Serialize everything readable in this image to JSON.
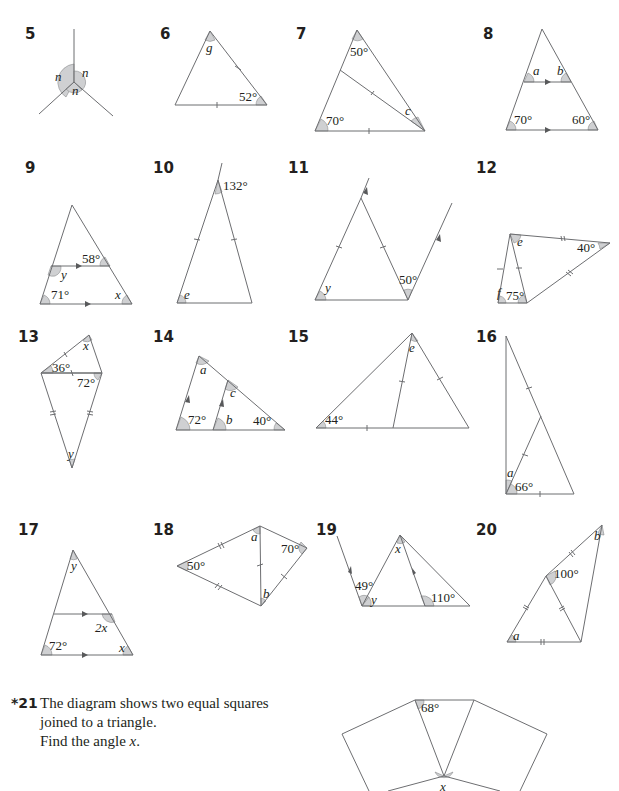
{
  "questions": [
    {
      "number": "5",
      "labels": [
        "n",
        "n",
        "n"
      ]
    },
    {
      "number": "6",
      "labels": [
        "g",
        "52°"
      ]
    },
    {
      "number": "7",
      "labels": [
        "50°",
        "70°",
        "c"
      ]
    },
    {
      "number": "8",
      "labels": [
        "a",
        "b",
        "70°",
        "60°"
      ]
    },
    {
      "number": "9",
      "labels": [
        "58°",
        "y",
        "71°",
        "x"
      ]
    },
    {
      "number": "10",
      "labels": [
        "132°",
        "e"
      ]
    },
    {
      "number": "11",
      "labels": [
        "y",
        "50°"
      ]
    },
    {
      "number": "12",
      "labels": [
        "e",
        "40°",
        "f",
        "75°"
      ]
    },
    {
      "number": "13",
      "labels": [
        "x",
        "36°",
        "72°",
        "y"
      ]
    },
    {
      "number": "14",
      "labels": [
        "a",
        "c",
        "72°",
        "b",
        "40°"
      ]
    },
    {
      "number": "15",
      "labels": [
        "e",
        "44°"
      ]
    },
    {
      "number": "16",
      "labels": [
        "a",
        "66°"
      ]
    },
    {
      "number": "17",
      "labels": [
        "y",
        "2x",
        "72°",
        "x"
      ]
    },
    {
      "number": "18",
      "labels": [
        "a",
        "70°",
        "50°",
        "b"
      ]
    },
    {
      "number": "19",
      "labels": [
        "x",
        "49°",
        "y",
        "110°"
      ]
    },
    {
      "number": "20",
      "labels": [
        "b",
        "100°",
        "a"
      ]
    },
    {
      "number": "*21",
      "labels": [
        "68°",
        "x"
      ]
    }
  ],
  "q21": {
    "star": "*21",
    "line1": "The diagram shows two equal squares",
    "line2": "joined to a triangle.",
    "line3_prefix": "Find the angle ",
    "line3_var": "x",
    "line3_suffix": "."
  }
}
